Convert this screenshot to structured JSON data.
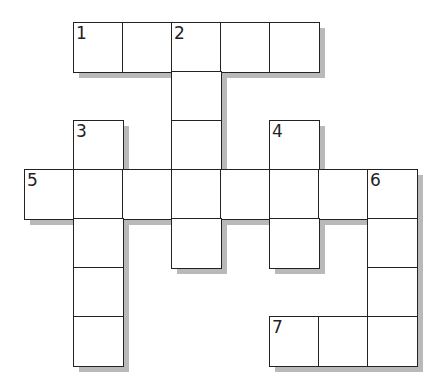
{
  "puzzle": {
    "type": "crossword",
    "grid_origin": {
      "x": 24,
      "y": 22
    },
    "cell_size": 49,
    "colors": {
      "border": "#222222",
      "cell": "#ffffff",
      "shadow": "#b9b9b9"
    },
    "cells": [
      {
        "row": 0,
        "col": 1,
        "number": "1"
      },
      {
        "row": 0,
        "col": 2,
        "number": ""
      },
      {
        "row": 0,
        "col": 3,
        "number": "2"
      },
      {
        "row": 0,
        "col": 4,
        "number": ""
      },
      {
        "row": 0,
        "col": 5,
        "number": ""
      },
      {
        "row": 1,
        "col": 3,
        "number": ""
      },
      {
        "row": 2,
        "col": 1,
        "number": "3"
      },
      {
        "row": 2,
        "col": 3,
        "number": ""
      },
      {
        "row": 2,
        "col": 5,
        "number": "4"
      },
      {
        "row": 3,
        "col": 0,
        "number": "5"
      },
      {
        "row": 3,
        "col": 1,
        "number": ""
      },
      {
        "row": 3,
        "col": 2,
        "number": ""
      },
      {
        "row": 3,
        "col": 3,
        "number": ""
      },
      {
        "row": 3,
        "col": 4,
        "number": ""
      },
      {
        "row": 3,
        "col": 5,
        "number": ""
      },
      {
        "row": 3,
        "col": 6,
        "number": ""
      },
      {
        "row": 3,
        "col": 7,
        "number": "6"
      },
      {
        "row": 4,
        "col": 1,
        "number": ""
      },
      {
        "row": 4,
        "col": 3,
        "number": ""
      },
      {
        "row": 4,
        "col": 5,
        "number": ""
      },
      {
        "row": 4,
        "col": 7,
        "number": ""
      },
      {
        "row": 5,
        "col": 1,
        "number": ""
      },
      {
        "row": 5,
        "col": 7,
        "number": ""
      },
      {
        "row": 6,
        "col": 1,
        "number": ""
      },
      {
        "row": 6,
        "col": 5,
        "number": "7"
      },
      {
        "row": 6,
        "col": 6,
        "number": ""
      },
      {
        "row": 6,
        "col": 7,
        "number": ""
      }
    ],
    "words": {
      "across": [
        {
          "number": "1",
          "length": 5
        },
        {
          "number": "5",
          "length": 8
        },
        {
          "number": "7",
          "length": 3
        }
      ],
      "down": [
        {
          "number": "2",
          "length": 5
        },
        {
          "number": "3",
          "length": 5
        },
        {
          "number": "4",
          "length": 3
        },
        {
          "number": "6",
          "length": 4
        }
      ]
    }
  }
}
